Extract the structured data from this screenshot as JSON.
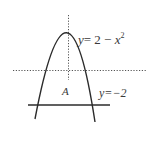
{
  "diagram": {
    "curve": {
      "label_y": "y",
      "label_eq": "= 2 − ",
      "label_x": "x",
      "label_exp": "2"
    },
    "line": {
      "label": "y=−2"
    },
    "region": {
      "label": "A"
    },
    "colors": {
      "stroke": "#2b2b2b",
      "axis": "#555555",
      "text": "#3a3a3a"
    }
  }
}
